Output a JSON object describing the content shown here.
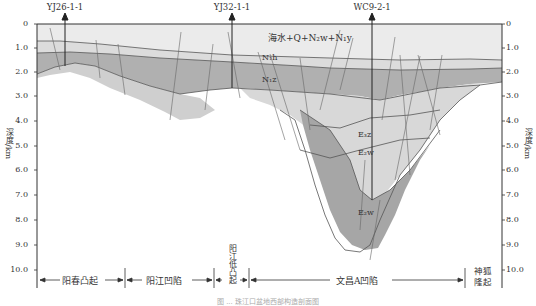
{
  "wells": [
    {
      "name": "YJ26-1-1",
      "x": 65
    },
    {
      "name": "YJ32-1-1",
      "x": 232
    },
    {
      "name": "WC9-2-1",
      "x": 372
    }
  ],
  "axis": {
    "title": "深度/km",
    "ticks": [
      "0",
      "1.0",
      "2.0",
      "3.0",
      "4.0",
      "5.0",
      "6.0",
      "7.0",
      "8.0",
      "9.0",
      "10.0"
    ]
  },
  "layers": {
    "top": "海水+Q+N₂w+N₁y",
    "n1h": "N₁h",
    "n1z": "N₁z",
    "e3z": "E₃z",
    "e3w1": "E₂w",
    "e2w": "E₂w"
  },
  "units": [
    {
      "name": "阳春凸起"
    },
    {
      "name": "阳江凹陷"
    },
    {
      "name": "阳江低凸起"
    },
    {
      "name": "文昌A凹陷"
    },
    {
      "name": "神狐隆起"
    }
  ],
  "caption": "图 ... 珠江口盆地西部构造剖面图",
  "colors": {
    "water": "#ebebeb",
    "light": "#dcdcdc",
    "mid": "#b4b4b4",
    "dark": "#a6a6a6",
    "line": "#555555"
  }
}
